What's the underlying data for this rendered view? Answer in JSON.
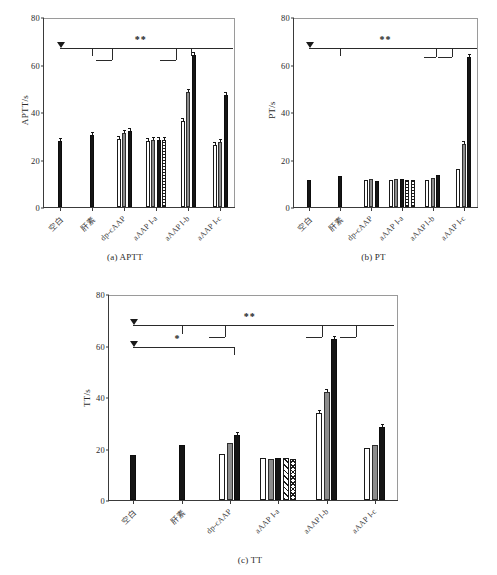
{
  "figure": {
    "panels": [
      "a",
      "b",
      "c"
    ]
  },
  "chart_data": [
    {
      "type": "bar",
      "panel": "a",
      "title": "(a) APTT",
      "xlabel": "",
      "ylabel": "APTT/s",
      "ylim": [
        0,
        80
      ],
      "yticks": [
        0,
        20,
        40,
        60,
        80
      ],
      "grid": false,
      "legend": "none",
      "categories": [
        "空白",
        "肝素",
        "dp-cAAP",
        "aAAP Ⅰ-a",
        "aAAP Ⅰ-b",
        "aAAP Ⅰ-c"
      ],
      "groups": [
        {
          "category": "空白",
          "bars": [
            {
              "fill": "black",
              "value": 28.0
            }
          ]
        },
        {
          "category": "肝素",
          "bars": [
            {
              "fill": "black",
              "value": 30.4
            }
          ]
        },
        {
          "category": "dp-cAAP",
          "bars": [
            {
              "fill": "white",
              "value": 28.7
            },
            {
              "fill": "gray",
              "value": 31.0
            },
            {
              "fill": "black",
              "value": 31.8
            }
          ]
        },
        {
          "category": "aAAP Ⅰ-a",
          "bars": [
            {
              "fill": "white",
              "value": 28.0
            },
            {
              "fill": "gray",
              "value": 28.2
            },
            {
              "fill": "black",
              "value": 28.3
            },
            {
              "fill": "dotgrid",
              "value": 28.4
            }
          ]
        },
        {
          "category": "aAAP Ⅰ-b",
          "bars": [
            {
              "fill": "white",
              "value": 36.2
            },
            {
              "fill": "gray",
              "value": 48.3
            },
            {
              "fill": "black",
              "value": 64.2
            }
          ]
        },
        {
          "category": "aAAP Ⅰ-c",
          "bars": [
            {
              "fill": "white",
              "value": 26.0
            },
            {
              "fill": "gray",
              "value": 27.3
            },
            {
              "fill": "black",
              "value": 47.2
            }
          ]
        }
      ],
      "significance": [
        {
          "marker": "**",
          "level": 1
        }
      ]
    },
    {
      "type": "bar",
      "panel": "b",
      "title": "(b) PT",
      "xlabel": "",
      "ylabel": "PT/s",
      "ylim": [
        0,
        80
      ],
      "yticks": [
        0,
        20,
        40,
        60,
        80
      ],
      "grid": false,
      "legend": "none",
      "categories": [
        "空白",
        "肝素",
        "dp-cAAP",
        "aAAP Ⅰ-a",
        "aAAP Ⅰ-b",
        "aAAP Ⅰ-c"
      ],
      "groups": [
        {
          "category": "空白",
          "bars": [
            {
              "fill": "black",
              "value": 11.3
            }
          ]
        },
        {
          "category": "肝素",
          "bars": [
            {
              "fill": "black",
              "value": 13.2
            }
          ]
        },
        {
          "category": "dp-cAAP",
          "bars": [
            {
              "fill": "white",
              "value": 11.5
            },
            {
              "fill": "gray",
              "value": 11.6
            },
            {
              "fill": "black",
              "value": 10.9
            }
          ]
        },
        {
          "category": "aAAP Ⅰ-a",
          "bars": [
            {
              "fill": "white",
              "value": 11.4
            },
            {
              "fill": "gray",
              "value": 11.6
            },
            {
              "fill": "black",
              "value": 11.6
            },
            {
              "fill": "dotgrid",
              "value": 11.5
            },
            {
              "fill": "dotgrid",
              "value": 11.3
            }
          ]
        },
        {
          "category": "aAAP Ⅰ-b",
          "bars": [
            {
              "fill": "white",
              "value": 11.3
            },
            {
              "fill": "gray",
              "value": 12.4
            },
            {
              "fill": "black",
              "value": 13.3
            }
          ]
        },
        {
          "category": "aAAP Ⅰ-c",
          "bars": [
            {
              "fill": "white",
              "value": 15.8
            },
            {
              "fill": "gray",
              "value": 26.5
            },
            {
              "fill": "black",
              "value": 63.0
            }
          ]
        }
      ],
      "significance": [
        {
          "marker": "**",
          "level": 1
        }
      ]
    },
    {
      "type": "bar",
      "panel": "c",
      "title": "(c) TT",
      "xlabel": "",
      "ylabel": "TT/s",
      "ylim": [
        0,
        80
      ],
      "yticks": [
        0,
        20,
        40,
        60,
        80
      ],
      "grid": false,
      "legend": "none",
      "categories": [
        "空白",
        "肝素",
        "dp-cAAP",
        "aAAP Ⅰ-a",
        "aAAP Ⅰ-b",
        "aAAP Ⅰ-c"
      ],
      "groups": [
        {
          "category": "空白",
          "bars": [
            {
              "fill": "black",
              "value": 17.5
            }
          ]
        },
        {
          "category": "肝素",
          "bars": [
            {
              "fill": "black",
              "value": 21.2
            }
          ]
        },
        {
          "category": "dp-cAAP",
          "bars": [
            {
              "fill": "white",
              "value": 17.9
            },
            {
              "fill": "gray",
              "value": 22.0
            },
            {
              "fill": "black",
              "value": 25.1
            }
          ]
        },
        {
          "category": "aAAP Ⅰ-a",
          "bars": [
            {
              "fill": "white",
              "value": 16.2
            },
            {
              "fill": "gray",
              "value": 16.1
            },
            {
              "fill": "black",
              "value": 16.2
            },
            {
              "fill": "hatch",
              "value": 16.2
            },
            {
              "fill": "cross",
              "value": 16.1
            }
          ]
        },
        {
          "category": "aAAP Ⅰ-b",
          "bars": [
            {
              "fill": "white",
              "value": 33.6
            },
            {
              "fill": "gray",
              "value": 42.0
            },
            {
              "fill": "black",
              "value": 62.5
            }
          ]
        },
        {
          "category": "aAAP Ⅰ-c",
          "bars": [
            {
              "fill": "white",
              "value": 20.2
            },
            {
              "fill": "gray",
              "value": 21.5
            },
            {
              "fill": "black",
              "value": 28.2
            }
          ]
        }
      ],
      "significance": [
        {
          "marker": "**",
          "level": 1
        },
        {
          "marker": "*",
          "level": 2
        }
      ]
    }
  ],
  "panel_a": {
    "ylabel": "APTT/s",
    "caption": "(a) APTT",
    "yticks": [
      "0",
      "20",
      "40",
      "60",
      "80"
    ],
    "xlabels": [
      "空白",
      "肝素",
      "dp-cAAP",
      "aAAP Ⅰ-a",
      "aAAP Ⅰ-b",
      "aAAP Ⅰ-c"
    ],
    "sig_star": "**"
  },
  "panel_b": {
    "ylabel": "PT/s",
    "caption": "(b) PT",
    "yticks": [
      "0",
      "20",
      "40",
      "60",
      "80"
    ],
    "xlabels": [
      "空白",
      "肝素",
      "dp-cAAP",
      "aAAP Ⅰ-a",
      "aAAP Ⅰ-b",
      "aAAP Ⅰ-c"
    ],
    "sig_star": "**"
  },
  "panel_c": {
    "ylabel": "TT/s",
    "caption": "(c) TT",
    "yticks": [
      "0",
      "20",
      "40",
      "60",
      "80"
    ],
    "xlabels": [
      "空白",
      "肝素",
      "dp-cAAP",
      "aAAP Ⅰ-a",
      "aAAP Ⅰ-b",
      "aAAP Ⅰ-c"
    ],
    "sig_star_1": "**",
    "sig_star_2": "*"
  }
}
